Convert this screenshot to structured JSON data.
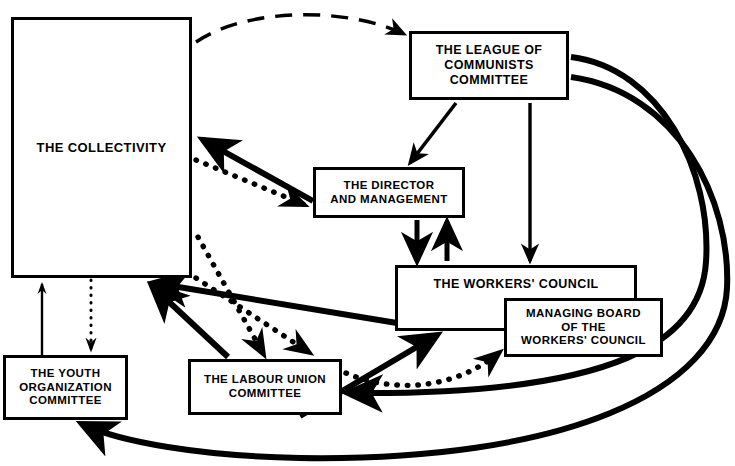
{
  "diagram": {
    "background_color": "#ffffff",
    "line_color": "#000000",
    "nodes": [
      {
        "id": "collectivity",
        "label": "THE COLLECTIVITY",
        "x": 11,
        "y": 17,
        "w": 181,
        "h": 261
      },
      {
        "id": "league",
        "label": "THE LEAGUE OF\nCOMMUNISTS\nCOMMITTEE",
        "x": 409,
        "y": 31,
        "w": 160,
        "h": 69
      },
      {
        "id": "director",
        "label": "THE DIRECTOR\nAND MANAGEMENT",
        "x": 313,
        "y": 167,
        "w": 152,
        "h": 51
      },
      {
        "id": "workers-council",
        "label": "THE WORKERS' COUNCIL",
        "x": 395,
        "y": 265,
        "w": 242,
        "h": 66
      },
      {
        "id": "managing-board",
        "label": "MANAGING BOARD\nOF THE\nWORKERS' COUNCIL",
        "x": 504,
        "y": 298,
        "w": 159,
        "h": 59
      },
      {
        "id": "youth",
        "label": "THE YOUTH\nORGANIZATION\nCOMMITTEE",
        "x": 3,
        "y": 355,
        "w": 125,
        "h": 65
      },
      {
        "id": "labour-union",
        "label": "THE LABOUR UNION\nCOMMITTEE",
        "x": 188,
        "y": 359,
        "w": 154,
        "h": 56
      }
    ],
    "edges": [
      {
        "id": "collectivity-to-league",
        "from": "collectivity",
        "to": "league",
        "style": "dashed",
        "weight": "medium"
      },
      {
        "id": "league-to-director",
        "from": "league",
        "to": "director",
        "style": "solid",
        "weight": "medium"
      },
      {
        "id": "league-to-workers-council",
        "from": "league",
        "to": "workers-council",
        "style": "solid",
        "weight": "medium"
      },
      {
        "id": "league-to-labour-union",
        "from": "league",
        "to": "labour-union",
        "style": "solid",
        "weight": "heavy"
      },
      {
        "id": "league-to-youth",
        "from": "league",
        "to": "youth",
        "style": "solid",
        "weight": "heavy"
      },
      {
        "id": "director-to-collectivity",
        "from": "director",
        "to": "collectivity",
        "style": "solid",
        "weight": "heavy"
      },
      {
        "id": "collectivity-to-director",
        "from": "collectivity",
        "to": "director",
        "style": "dotted",
        "weight": "medium"
      },
      {
        "id": "director-to-workers-council",
        "from": "director",
        "to": "workers-council",
        "style": "solid",
        "weight": "heavy"
      },
      {
        "id": "workers-council-to-director",
        "from": "workers-council",
        "to": "director",
        "style": "solid",
        "weight": "heavy"
      },
      {
        "id": "workers-council-to-collectivity",
        "from": "workers-council",
        "to": "collectivity",
        "style": "solid",
        "weight": "heavy"
      },
      {
        "id": "collectivity-to-labour-union",
        "from": "collectivity",
        "to": "labour-union",
        "style": "dotted",
        "weight": "medium"
      },
      {
        "id": "collectivity-to-labour-union-2",
        "from": "collectivity",
        "to": "labour-union",
        "style": "dotted",
        "weight": "medium"
      },
      {
        "id": "labour-union-to-collectivity",
        "from": "labour-union",
        "to": "collectivity",
        "style": "solid",
        "weight": "heavy"
      },
      {
        "id": "labour-union-to-workers-council",
        "from": "labour-union",
        "to": "workers-council",
        "style": "solid",
        "weight": "heavy"
      },
      {
        "id": "labour-union-to-managing-board",
        "from": "labour-union",
        "to": "managing-board",
        "style": "dotted",
        "weight": "medium"
      },
      {
        "id": "youth-to-collectivity",
        "from": "youth",
        "to": "collectivity",
        "style": "solid",
        "weight": "light"
      },
      {
        "id": "collectivity-to-youth",
        "from": "collectivity",
        "to": "youth",
        "style": "dotted",
        "weight": "light"
      }
    ]
  }
}
